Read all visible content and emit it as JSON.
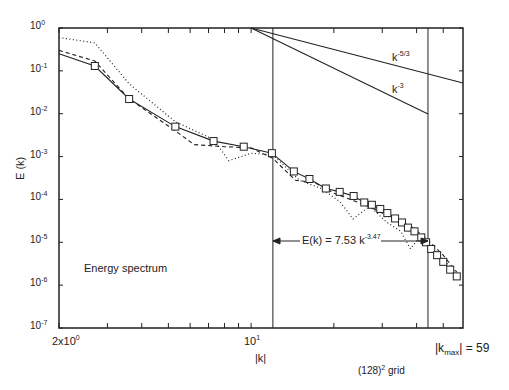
{
  "chart_data": {
    "type": "line",
    "title": "Energy spectrum",
    "xlabel": "|k|",
    "ylabel": "E (k)",
    "xscale": "log",
    "yscale": "log",
    "xlim": [
      2,
      59
    ],
    "ylim": [
      1e-07,
      1
    ],
    "x_tick_labels": [
      "2x10^0",
      "10^1"
    ],
    "y_tick_labels": [
      "10^0",
      "10^-1",
      "10^-2",
      "10^-3",
      "10^-4",
      "10^-5",
      "10^-6",
      "10^-7"
    ],
    "grid": false,
    "annotations": {
      "grid_note": "(128)^2 grid",
      "kmax_label": "|k_max| = 59",
      "fit_label": "E(k) = 7.53 k^-3.47",
      "fit_range": [
        12,
        44
      ],
      "reference_slopes": [
        "k^-5/3",
        "k^-3"
      ]
    },
    "series": [
      {
        "name": "solid with squares",
        "style": "solid",
        "marker": "square",
        "k": [
          2,
          2.7,
          3.6,
          5.3,
          7.3,
          9.4,
          11.9,
          14.3,
          16.3,
          18.7,
          21,
          23.6,
          25.8,
          27.5,
          29.5,
          31.3,
          33.4,
          35.4,
          37.2,
          39.3,
          41.6,
          43.3,
          45.2,
          47.5,
          50,
          53,
          56
        ],
        "E": [
          0.25,
          0.13,
          0.022,
          0.005,
          0.0023,
          0.0017,
          0.0012,
          0.00045,
          0.0003,
          0.00018,
          0.00015,
          0.00012,
          8.5e-05,
          7.5e-05,
          6e-05,
          4.8e-05,
          3.6e-05,
          2.9e-05,
          2.2e-05,
          1.8e-05,
          1.3e-05,
          1e-05,
          7e-06,
          5e-06,
          3.5e-06,
          2.3e-06,
          1.6e-06
        ]
      },
      {
        "name": "dashed",
        "style": "dashed",
        "k": [
          2,
          2.7,
          3.6,
          5.3,
          6.2,
          8,
          10,
          12,
          14.5,
          17,
          20,
          24,
          28,
          33,
          38,
          43,
          50,
          56
        ],
        "E": [
          0.3,
          0.17,
          0.022,
          0.004,
          0.0019,
          0.0017,
          0.0016,
          0.0009,
          0.00028,
          0.00025,
          0.00014,
          9e-05,
          6e-05,
          3.5e-05,
          2.4e-05,
          1.3e-05,
          5e-06,
          2e-06
        ]
      },
      {
        "name": "dotted",
        "style": "dotted",
        "k": [
          2,
          2.7,
          3.6,
          5.3,
          7.3,
          8.3,
          10,
          12,
          15,
          18,
          21,
          23.5,
          27,
          31,
          35,
          38,
          42,
          46,
          50,
          56
        ],
        "E": [
          0.6,
          0.45,
          0.05,
          0.0065,
          0.0025,
          0.0008,
          0.0012,
          0.0011,
          0.00028,
          0.00018,
          9e-05,
          3.5e-05,
          7e-05,
          3e-05,
          1.8e-05,
          7e-06,
          1.6e-05,
          6e-06,
          3.8e-06,
          2e-06
        ]
      },
      {
        "name": "k^-5/3 reference",
        "style": "solid",
        "k": [
          10,
          59
        ],
        "E": [
          1,
          0.052
        ]
      },
      {
        "name": "k^-3 reference",
        "style": "solid",
        "k": [
          10,
          44
        ],
        "E": [
          1,
          0.0098
        ]
      }
    ]
  },
  "labels": {
    "y_axis": "E (k)",
    "x_axis": "|k|",
    "legend_text": "Energy spectrum",
    "grid_note_base": "(128)",
    "grid_note_sup": "2",
    "grid_note_tail": " grid",
    "kmax_prefix": "|k",
    "kmax_sub": "max",
    "kmax_suffix": "| = 59",
    "fit_prefix": "E(k) = 7.53  k",
    "fit_exp": "-3.47",
    "ref1_base": "k",
    "ref1_exp": "-5/3",
    "ref2_base": "k",
    "ref2_exp": "-3",
    "xtick_2_base": "2x10",
    "xtick_2_exp": "0",
    "xtick_10_base": "10",
    "xtick_10_exp": "1",
    "ytick_base": "10",
    "ytick_exps": [
      "0",
      "-1",
      "-2",
      "-3",
      "-4",
      "-5",
      "-6",
      "-7"
    ]
  }
}
